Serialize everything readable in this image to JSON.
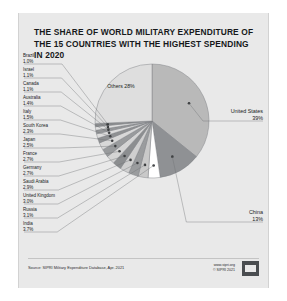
{
  "title": "THE SHARE OF WORLD MILITARY EXPENDITURE OF THE 15 COUNTRIES WITH THE HIGHEST SPENDING IN 2020",
  "footer": {
    "source": "Source: SIPRI Military Expenditure Database, Apr. 2021",
    "website": "www.sipri.org",
    "copyright": "© SIPRI 2021",
    "logo_alt": "sipri-logo"
  },
  "chart_data": {
    "type": "pie",
    "title": "The share of world military expenditure of the 15 countries with the highest spending in 2020",
    "unit": "percent of world military expenditure",
    "legend": "none",
    "labels": [
      "United States",
      "China",
      "India",
      "Russia",
      "United Kingdom",
      "Saudi Arabia",
      "Germany",
      "France",
      "Japan",
      "South Korea",
      "Italy",
      "Australia",
      "Canada",
      "Israel",
      "Brazil",
      "Others"
    ],
    "values": [
      39,
      13,
      3.7,
      3.1,
      3.0,
      2.9,
      2.7,
      2.7,
      2.5,
      2.3,
      1.5,
      1.4,
      1.1,
      1.1,
      1.0,
      28
    ],
    "slices": [
      {
        "label": "United States",
        "value": 39,
        "display": "39%",
        "color": "#b9b9b9",
        "side": "right",
        "emphasis": true
      },
      {
        "label": "China",
        "value": 13,
        "display": "13%",
        "color": "#8f9194",
        "side": "right",
        "emphasis": true
      },
      {
        "label": "India",
        "value": 3.7,
        "display": "3.7%",
        "color": "#ffffff",
        "side": "left",
        "emphasis": false
      },
      {
        "label": "Russia",
        "value": 3.1,
        "display": "3.1%",
        "color": "#c9c9c9",
        "side": "left",
        "emphasis": false
      },
      {
        "label": "United Kingdom",
        "value": 3.0,
        "display": "3.0%",
        "color": "#9a9c9e",
        "side": "left",
        "emphasis": false
      },
      {
        "label": "Saudi Arabia",
        "value": 2.9,
        "display": "2.9%",
        "color": "#cfcfcf",
        "side": "left",
        "emphasis": false
      },
      {
        "label": "Germany",
        "value": 2.7,
        "display": "2.7%",
        "color": "#8c8e90",
        "side": "left",
        "emphasis": false
      },
      {
        "label": "France",
        "value": 2.7,
        "display": "2.7%",
        "color": "#d4d4d4",
        "side": "left",
        "emphasis": false
      },
      {
        "label": "Japan",
        "value": 2.5,
        "display": "2.5%",
        "color": "#999b9d",
        "side": "left",
        "emphasis": false
      },
      {
        "label": "South Korea",
        "value": 2.3,
        "display": "2.3%",
        "color": "#d8d8d8",
        "side": "left",
        "emphasis": false
      },
      {
        "label": "Italy",
        "value": 1.5,
        "display": "1.5%",
        "color": "#8f9193",
        "side": "left",
        "emphasis": false
      },
      {
        "label": "Australia",
        "value": 1.4,
        "display": "1.4%",
        "color": "#dcdcdc",
        "side": "left",
        "emphasis": false
      },
      {
        "label": "Canada",
        "value": 1.1,
        "display": "1.1%",
        "color": "#949698",
        "side": "left",
        "emphasis": false
      },
      {
        "label": "Israel",
        "value": 1.1,
        "display": "1.1%",
        "color": "#e0e0e0",
        "side": "left",
        "emphasis": false
      },
      {
        "label": "Brazil",
        "value": 1.0,
        "display": "1.0%",
        "color": "#8a8c8e",
        "side": "left",
        "emphasis": false
      },
      {
        "label": "Others",
        "value": 28,
        "display": "28%",
        "color": "#dedede",
        "side": "inside",
        "emphasis": false
      }
    ]
  }
}
